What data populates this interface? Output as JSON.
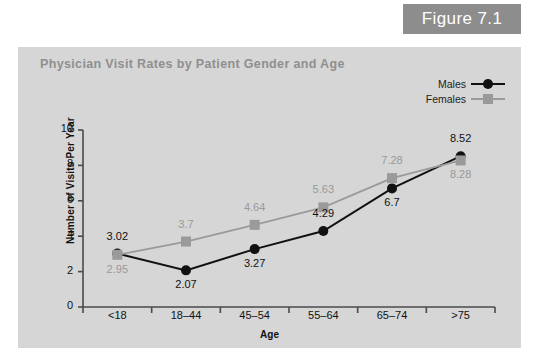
{
  "figure": {
    "badge_label": "Figure 7.1",
    "badge_color": "#8d8d8d"
  },
  "panel": {
    "background_color": "#d6d6d6"
  },
  "chart_data": {
    "type": "line",
    "title": "Physician Visit Rates by Patient Gender and Age",
    "xlabel": "Age",
    "ylabel": "Number of Visits Per Year",
    "categories": [
      "<18",
      "18–44",
      "45–54",
      "55–64",
      "65–74",
      ">75"
    ],
    "ylim": [
      0,
      10
    ],
    "yticks": [
      0,
      2,
      4,
      6,
      8,
      10
    ],
    "ytick_labels": [
      "0",
      "2",
      "4",
      "6",
      "8",
      "10"
    ],
    "grid": false,
    "legend_position": "top-right",
    "series": [
      {
        "name": "Males",
        "color": "#111111",
        "marker": "circle",
        "values": [
          3.02,
          2.07,
          3.27,
          4.29,
          6.7,
          8.52
        ],
        "value_labels": [
          "3.02",
          "2.07",
          "3.27",
          "4.29",
          "6.7",
          "8.52"
        ],
        "label_placement": [
          "above",
          "below",
          "below",
          "above",
          "below",
          "above"
        ]
      },
      {
        "name": "Females",
        "color": "#9a9a9a",
        "marker": "square",
        "values": [
          2.95,
          3.7,
          4.64,
          5.63,
          7.28,
          8.28
        ],
        "value_labels": [
          "2.95",
          "3.7",
          "4.64",
          "5.63",
          "7.28",
          "8.28"
        ],
        "label_placement": [
          "below",
          "above",
          "above",
          "above",
          "above",
          "below"
        ]
      }
    ]
  }
}
